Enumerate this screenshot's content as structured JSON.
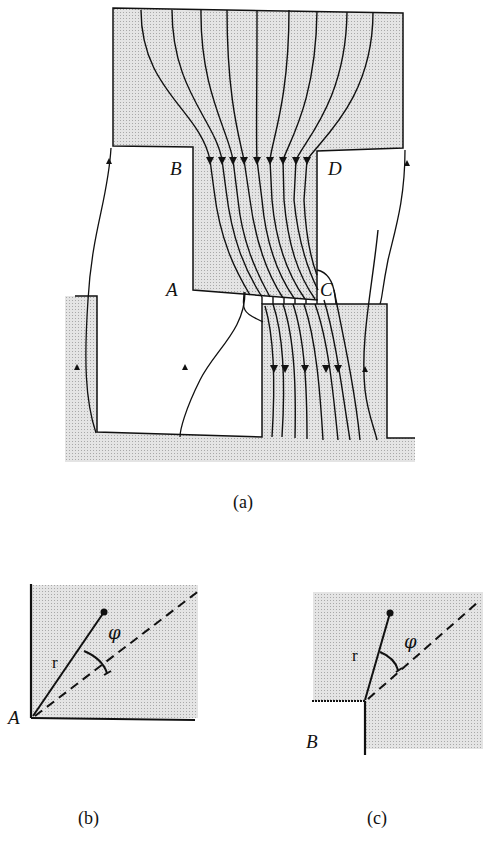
{
  "figure": {
    "panel_a": {
      "caption": "(a)",
      "labels": {
        "A": "A",
        "B": "B",
        "C": "C",
        "D": "D"
      }
    },
    "panel_b": {
      "caption": "(b)",
      "corner_label": "A",
      "radius_label": "r",
      "angle_label": "φ"
    },
    "panel_c": {
      "caption": "(c)",
      "corner_label": "B",
      "radius_label": "r",
      "angle_label": "φ"
    },
    "colors": {
      "shading": "#d9d9d9",
      "line": "#111111",
      "background": "#ffffff"
    }
  }
}
